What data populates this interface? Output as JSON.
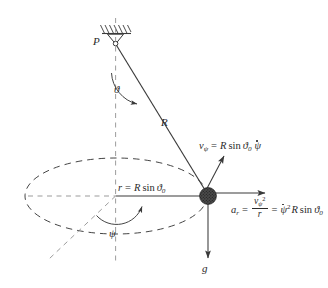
{
  "figure": {
    "name": "spherical-pendulum-diagram",
    "stroke_color": "#3a3a3a",
    "bob_color": "#3d3d3d",
    "background": "#ffffff"
  },
  "labels": {
    "pivot": "P",
    "polar_angle": "ϑ",
    "string_length": "R",
    "radius_prefix": "r",
    "azimuth_angle": "ψ",
    "gravity": "g"
  },
  "equations": {
    "radius": {
      "lhs": "r",
      "equals": "=",
      "rhs_R": "R",
      "rhs_sin": "sin",
      "rhs_theta": "ϑ",
      "rhs_sub": "0"
    },
    "tangential_velocity": {
      "lhs_v": "v",
      "lhs_sub": "ψ",
      "equals": "=",
      "rhs_R": "R",
      "rhs_sin": "sin",
      "rhs_theta": "ϑ",
      "rhs_theta_sub": "0",
      "rhs_psidot": "ψ"
    },
    "radial_acceleration": {
      "lhs_a": "a",
      "lhs_sub": "r",
      "equals1": "=",
      "frac_num_v": "v",
      "frac_num_sub": "ψ",
      "frac_num_sup": "2",
      "frac_den": "r",
      "equals2": "=",
      "rhs_psidot": "ψ",
      "rhs_psidot_sup": "2",
      "rhs_R": "R",
      "rhs_sin": "sin",
      "rhs_theta": "ϑ",
      "rhs_theta_sub": "0"
    }
  },
  "elements": {
    "ceiling_support": "hatched-ceiling-support",
    "pivot_hinge": "triangular-hinge",
    "vertical_axis": "vertical-dashed-axis",
    "string": "pendulum-string",
    "orbit": "dashed-elliptical-orbit",
    "radius_line": "radius-arrow",
    "reference_line": "azimuth-reference-line",
    "velocity_arrow": "tangential-velocity-arrow",
    "acceleration_arrow": "radial-acceleration-arrow",
    "gravity_arrow": "gravity-arrow",
    "theta_arc": "polar-angle-arc",
    "psi_arc": "azimuth-angle-arc",
    "bob": "pendulum-bob"
  }
}
